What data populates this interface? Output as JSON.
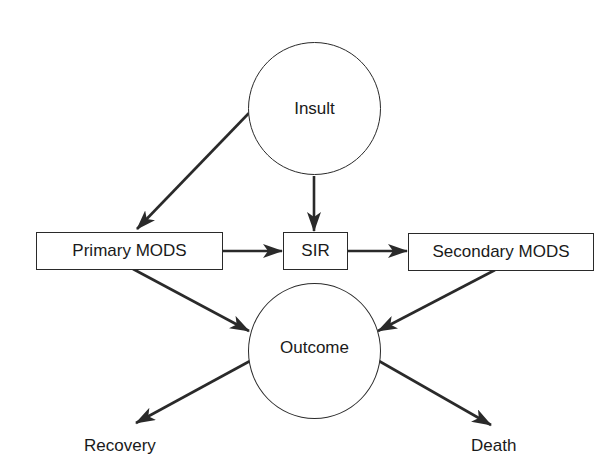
{
  "diagram": {
    "type": "flow-diagram",
    "nodes": {
      "insult": {
        "label": "Insult",
        "shape": "circle"
      },
      "primary_mods": {
        "label": "Primary MODS",
        "shape": "rectangle"
      },
      "sir": {
        "label": "SIR",
        "shape": "rectangle"
      },
      "secondary_mods": {
        "label": "Secondary MODS",
        "shape": "rectangle"
      },
      "outcome": {
        "label": "Outcome",
        "shape": "circle"
      },
      "recovery": {
        "label": "Recovery",
        "shape": "text"
      },
      "death": {
        "label": "Death",
        "shape": "text"
      }
    },
    "edges": [
      {
        "from": "Insult",
        "to": "Primary MODS"
      },
      {
        "from": "Insult",
        "to": "SIR"
      },
      {
        "from": "Primary MODS",
        "to": "SIR"
      },
      {
        "from": "SIR",
        "to": "Secondary MODS"
      },
      {
        "from": "Primary MODS",
        "to": "Outcome"
      },
      {
        "from": "Secondary MODS",
        "to": "Outcome"
      },
      {
        "from": "Outcome",
        "to": "Recovery"
      },
      {
        "from": "Outcome",
        "to": "Death"
      }
    ],
    "colors": {
      "stroke": "#2a2a2a",
      "text": "#1a1a1a",
      "background": "#ffffff"
    }
  }
}
